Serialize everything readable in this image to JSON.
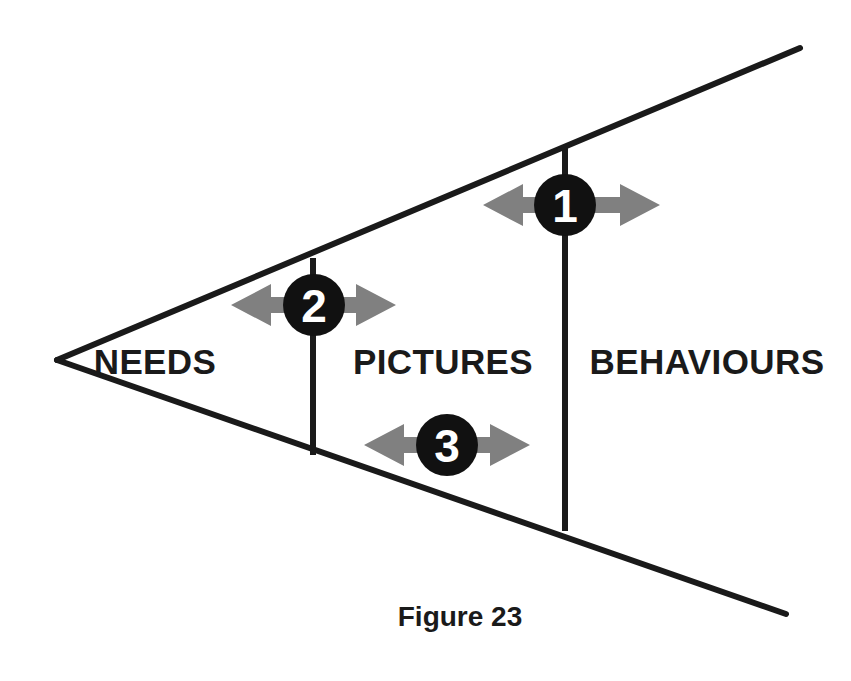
{
  "figure": {
    "caption": "Figure 23",
    "caption_x": 460,
    "caption_y": 626
  },
  "colors": {
    "background": "#ffffff",
    "line": "#1a1a1a",
    "badge_fill": "#111111",
    "badge_text": "#ffffff",
    "arrow_fill": "#808080",
    "label_text": "#1a1a1a"
  },
  "wedge": {
    "apex": {
      "x": 57,
      "y": 360
    },
    "top_end": {
      "x": 800,
      "y": 48
    },
    "bottom_end": {
      "x": 786,
      "y": 614
    },
    "stroke_width": 6
  },
  "dividers": [
    {
      "name": "needs-pictures-divider",
      "x": 313,
      "y_top": 258,
      "y_bottom": 455,
      "stroke_width": 6
    },
    {
      "name": "pictures-behaviours-divider",
      "x": 565,
      "y_top": 147,
      "y_bottom": 531,
      "stroke_width": 6
    }
  ],
  "zones": [
    {
      "id": "needs",
      "label": "NEEDS",
      "x": 155,
      "y": 365,
      "anchor": "middle"
    },
    {
      "id": "pictures",
      "label": "PICTURES",
      "x": 443,
      "y": 365,
      "anchor": "middle"
    },
    {
      "id": "behaviours",
      "label": "BEHAVIOURS",
      "x": 707,
      "y": 365,
      "anchor": "middle"
    }
  ],
  "badges": [
    {
      "id": "badge-1",
      "number": "1",
      "cx": 565,
      "cy": 205,
      "r": 31,
      "arrow_left_tip": 483,
      "arrow_right_tip": 660,
      "arrow_half_height": 21,
      "arrow_shaft_half_height": 8
    },
    {
      "id": "badge-2",
      "number": "2",
      "cx": 314,
      "cy": 305,
      "r": 31,
      "arrow_left_tip": 231,
      "arrow_right_tip": 396,
      "arrow_half_height": 21,
      "arrow_shaft_half_height": 8
    },
    {
      "id": "badge-3",
      "number": "3",
      "cx": 447,
      "cy": 445,
      "r": 31,
      "arrow_left_tip": 364,
      "arrow_right_tip": 530,
      "arrow_half_height": 21,
      "arrow_shaft_half_height": 8
    }
  ]
}
